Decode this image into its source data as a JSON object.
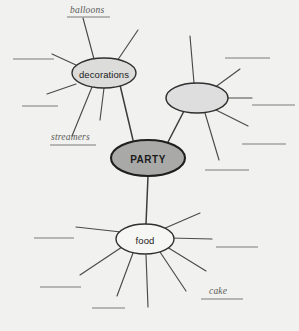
{
  "worksheet": {
    "type": "concept-map",
    "title": "PARTY concept map",
    "background_color": "#f1f1ef"
  },
  "colors": {
    "background": "#f1f1ef",
    "center_node_fill": "#a9a9a7",
    "branch_node_fill": "#dcdcda",
    "blank_node_fill": "#dedede",
    "leaf_node_fill": "#f6f6f4",
    "node_stroke": "#2f2f2f",
    "spoke_stroke": "#4a4a4a",
    "rule_stroke": "#7d7d7d",
    "handwriting_text": "#5a5a58"
  },
  "nodes": {
    "center": {
      "label": "PARTY",
      "cx": 148,
      "cy": 158,
      "rx": 37,
      "ry": 18
    },
    "decorations": {
      "label": "decorations",
      "cx": 104,
      "cy": 73,
      "rx": 32,
      "ry": 15
    },
    "blank_branch": {
      "label": "",
      "cx": 197,
      "cy": 98,
      "rx": 31,
      "ry": 15
    },
    "food": {
      "label": "food",
      "cx": 145,
      "cy": 239,
      "rx": 29,
      "ry": 15
    }
  },
  "trunks": [
    {
      "name": "decorations-to-party",
      "from": "decorations",
      "to": "center"
    },
    {
      "name": "blank-branch-to-party",
      "from": "blank_branch",
      "to": "center"
    },
    {
      "name": "party-to-food",
      "from": "center",
      "to": "food"
    }
  ],
  "spokes": {
    "decorations": [
      {
        "x1": 94,
        "y1": 59,
        "x2": 83,
        "y2": 18,
        "answer_line": null
      },
      {
        "x1": 117,
        "y1": 61,
        "x2": 138,
        "y2": 30,
        "answer_line": null
      },
      {
        "x1": 76,
        "y1": 65,
        "x2": 52,
        "y2": 54,
        "answer_line": {
          "x1": 13,
          "y1": 59,
          "x2": 54,
          "y2": 59
        }
      },
      {
        "x1": 76,
        "y1": 84,
        "x2": 47,
        "y2": 94,
        "answer_line": {
          "x1": 22,
          "y1": 106,
          "x2": 58,
          "y2": 106
        }
      },
      {
        "x1": 92,
        "y1": 87,
        "x2": 72,
        "y2": 136,
        "answer_line": null
      },
      {
        "x1": 104,
        "y1": 88,
        "x2": 100,
        "y2": 120,
        "answer_line": null
      },
      {
        "x1": 120,
        "y1": 85,
        "x2": 133,
        "y2": 140,
        "answer_line": null
      }
    ],
    "blank_branch": [
      {
        "x1": 194,
        "y1": 83,
        "x2": 190,
        "y2": 36,
        "answer_line": null
      },
      {
        "x1": 214,
        "y1": 88,
        "x2": 240,
        "y2": 69,
        "answer_line": {
          "x1": 225,
          "y1": 58,
          "x2": 270,
          "y2": 58
        }
      },
      {
        "x1": 228,
        "y1": 98,
        "x2": 252,
        "y2": 98,
        "answer_line": {
          "x1": 252,
          "y1": 105,
          "x2": 295,
          "y2": 105
        }
      },
      {
        "x1": 216,
        "y1": 110,
        "x2": 248,
        "y2": 126,
        "answer_line": {
          "x1": 242,
          "y1": 144,
          "x2": 286,
          "y2": 144
        }
      },
      {
        "x1": 205,
        "y1": 113,
        "x2": 219,
        "y2": 160,
        "answer_line": {
          "x1": 205,
          "y1": 170,
          "x2": 249,
          "y2": 170
        }
      },
      {
        "x1": 184,
        "y1": 111,
        "x2": 170,
        "y2": 139,
        "answer_line": null
      }
    ],
    "food": [
      {
        "x1": 121,
        "y1": 232,
        "x2": 76,
        "y2": 227,
        "answer_line": {
          "x1": 34,
          "y1": 238,
          "x2": 74,
          "y2": 238
        }
      },
      {
        "x1": 170,
        "y1": 238,
        "x2": 212,
        "y2": 239,
        "answer_line": {
          "x1": 216,
          "y1": 247,
          "x2": 258,
          "y2": 247
        }
      },
      {
        "x1": 122,
        "y1": 247,
        "x2": 80,
        "y2": 275,
        "answer_line": {
          "x1": 40,
          "y1": 287,
          "x2": 81,
          "y2": 287
        }
      },
      {
        "x1": 133,
        "y1": 253,
        "x2": 117,
        "y2": 296,
        "answer_line": {
          "x1": 92,
          "y1": 308,
          "x2": 125,
          "y2": 308
        }
      },
      {
        "x1": 146,
        "y1": 255,
        "x2": 148,
        "y2": 307,
        "answer_line": null
      },
      {
        "x1": 160,
        "y1": 252,
        "x2": 186,
        "y2": 291,
        "answer_line": null
      },
      {
        "x1": 167,
        "y1": 247,
        "x2": 206,
        "y2": 271,
        "answer_line": null
      },
      {
        "x1": 163,
        "y1": 229,
        "x2": 200,
        "y2": 213,
        "answer_line": null
      }
    ]
  },
  "filled_labels": [
    {
      "name": "balloons",
      "text": "balloons",
      "left": 70,
      "top": 5,
      "rule_x1": 67,
      "rule_y1": 17,
      "rule_x2": 110,
      "rule_y2": 17
    },
    {
      "name": "streamers",
      "text": "streamers",
      "left": 51,
      "top": 132,
      "rule_x1": 50,
      "rule_y1": 145,
      "rule_x2": 96,
      "rule_y2": 145
    },
    {
      "name": "cake",
      "text": "cake",
      "left": 209,
      "top": 286,
      "rule_x1": 201,
      "rule_y1": 299,
      "rule_x2": 243,
      "rule_y2": 299
    }
  ],
  "extra_rules": [
    {
      "name": "bottom-right-rule",
      "x1": 216,
      "y1": 247,
      "x2": 258,
      "y2": 247
    }
  ]
}
